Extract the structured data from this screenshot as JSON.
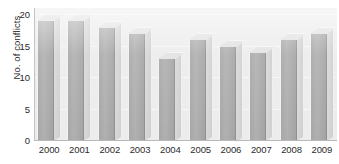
{
  "chart_data": {
    "type": "bar",
    "title": "",
    "subtitle": "",
    "xlabel": "",
    "ylabel": "No. of conflicts",
    "categories": [
      "2000",
      "2001",
      "2002",
      "2003",
      "2004",
      "2005",
      "2006",
      "2007",
      "2008",
      "2009"
    ],
    "values": [
      19,
      19,
      18,
      17,
      13,
      16,
      15,
      14,
      16,
      17
    ],
    "ylim": [
      0,
      20
    ],
    "yticks": [
      0,
      5,
      10,
      15,
      20
    ],
    "ytick_labels": [
      "0",
      "5",
      "10",
      "15",
      "20"
    ],
    "grid": true,
    "legend": null,
    "style": "3d-column",
    "colors": {
      "bar_front": "#a8a8a8",
      "bar_side": "#d4d4d4",
      "bar_top": "#e2e2e2",
      "plot_background": "#ebebeb",
      "gridline": "#f7f7f7",
      "text": "#2b2b2b",
      "axis": "#bcbcbc",
      "page_background": "#ffffff"
    }
  }
}
